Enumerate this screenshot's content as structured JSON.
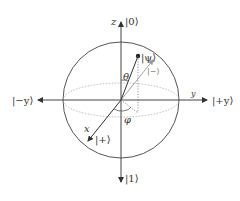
{
  "diagram": {
    "type": "bloch-sphere",
    "labels": {
      "z_axis": "z",
      "y_axis": "y",
      "x_axis": "x",
      "ket_zero": "|0⟩",
      "ket_one": "|1⟩",
      "ket_plus_y": "|+y⟩",
      "ket_minus_y": "|−y⟩",
      "ket_plus": "|+⟩",
      "ket_minus": "|−⟩",
      "ket_psi": "|ψ⟩",
      "theta": "θ",
      "phi": "φ"
    },
    "colors": {
      "axis": "#444444",
      "sphere": "#555555",
      "equator": "#aaaaaa",
      "minus_ket": "#999999"
    }
  }
}
